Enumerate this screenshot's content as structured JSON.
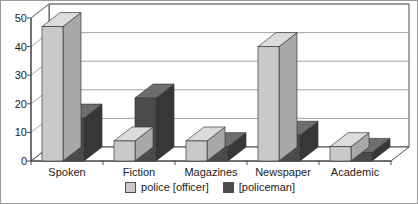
{
  "chart_data": {
    "type": "bar",
    "title": "",
    "xlabel": "",
    "ylabel": "",
    "ylim": [
      0,
      50
    ],
    "ytick_step": 10,
    "yticks": [
      0,
      10,
      20,
      30,
      40,
      50
    ],
    "grid": true,
    "three_d": true,
    "legend_position": "bottom-center",
    "categories": [
      "Spoken",
      "Fiction",
      "Magazines",
      "Newspaper",
      "Academic"
    ],
    "series": [
      {
        "name": "police [officer]",
        "color": "#c9c9c9",
        "values": [
          47,
          7,
          7,
          40,
          5
        ]
      },
      {
        "name": "[policeman]",
        "color": "#4b4b4b",
        "values": [
          15,
          22,
          5,
          9,
          3
        ]
      }
    ]
  },
  "colors": {
    "series_light_face": "#c9c9c9",
    "series_light_top": "#dcdcdc",
    "series_light_side": "#a8a8a8",
    "series_dark_face": "#4b4b4b",
    "series_dark_top": "#6e6e6e",
    "series_dark_side": "#373737",
    "gridline": "#8c8c8c",
    "axis": "#3a3a3a",
    "wall": "#ffffff",
    "floor": "#ffffff",
    "text": "#1b1b1b",
    "border": "#9a9a9a"
  }
}
